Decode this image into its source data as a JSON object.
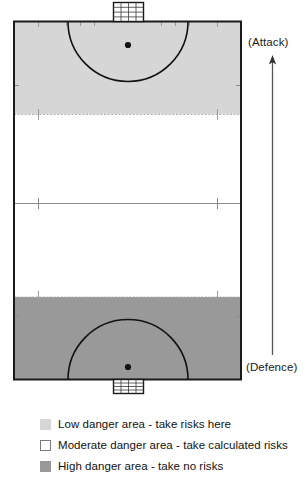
{
  "diagram": {
    "direction_labels": {
      "attack": "(Attack)",
      "defence": "(Defence)"
    },
    "arrow": {
      "name": "direction-of-play-arrow",
      "points": "up",
      "from_label": "(Defence)",
      "to_label": "(Attack)"
    },
    "pitch": {
      "outline_color": "#1a1a1a",
      "zones": [
        {
          "key": "low",
          "label": "Low danger area",
          "color": "#d6d6d6",
          "position": "attacking-third"
        },
        {
          "key": "moderate",
          "label": "Moderate danger area",
          "color": "#ffffff",
          "position": "middle-third"
        },
        {
          "key": "high",
          "label": "High danger area",
          "color": "#999999",
          "position": "defending-third"
        }
      ],
      "markings": [
        {
          "name": "goal-top",
          "type": "goal"
        },
        {
          "name": "goal-bottom",
          "type": "goal"
        },
        {
          "name": "shooting-circle-top",
          "type": "arc"
        },
        {
          "name": "shooting-circle-bottom",
          "type": "arc"
        },
        {
          "name": "penalty-spot-top",
          "type": "spot"
        },
        {
          "name": "penalty-spot-bottom",
          "type": "spot"
        },
        {
          "name": "23m-line-top",
          "type": "dashed-line"
        },
        {
          "name": "23m-line-bottom",
          "type": "dashed-line"
        },
        {
          "name": "halfway-line",
          "type": "solid-line"
        }
      ]
    }
  },
  "legend": {
    "items": [
      {
        "swatch": "low",
        "text": "Low danger area - take risks here"
      },
      {
        "swatch": "moderate",
        "text": "Moderate danger area - take calculated risks"
      },
      {
        "swatch": "high",
        "text": "High danger area - take no risks"
      }
    ]
  },
  "colors": {
    "low_danger": "#d6d6d6",
    "moderate_danger": "#ffffff",
    "high_danger": "#999999",
    "line": "#1a1a1a",
    "text": "#111111"
  }
}
